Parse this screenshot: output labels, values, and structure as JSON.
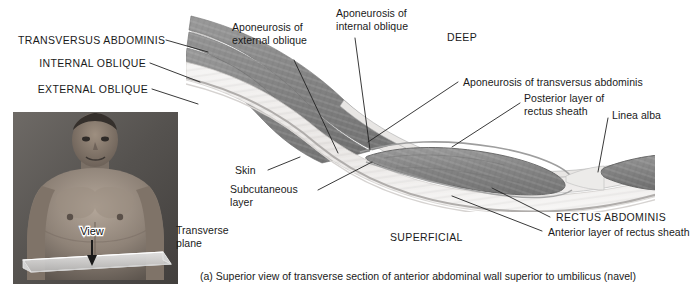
{
  "figure": {
    "caption": "(a) Superior view of transverse section of anterior abdominal wall superior to umbilicus (navel)",
    "background_color": "#ffffff",
    "text_color": "#1a1a1a",
    "leader_line_color": "#222222"
  },
  "orientation_labels": [
    {
      "id": "deep",
      "text": "DEEP"
    },
    {
      "id": "superficial",
      "text": "SUPERFICIAL"
    }
  ],
  "left_labels": [
    {
      "id": "transversus-abdominis",
      "text": "TRANSVERSUS ABDOMINIS",
      "style": "caps"
    },
    {
      "id": "internal-oblique",
      "text": "INTERNAL OBLIQUE",
      "style": "caps"
    },
    {
      "id": "external-oblique",
      "text": "EXTERNAL OBLIQUE",
      "style": "caps"
    }
  ],
  "top_labels": [
    {
      "id": "aponeurosis-external-oblique",
      "line1": "Aponeurosis of",
      "line2": "external oblique"
    },
    {
      "id": "aponeurosis-internal-oblique",
      "line1": "Aponeurosis of",
      "line2": "internal oblique"
    }
  ],
  "right_labels": [
    {
      "id": "aponeurosis-transversus-abdominis",
      "text": "Aponeurosis of transversus abdominis"
    },
    {
      "id": "posterior-layer-rectus-sheath",
      "line1": "Posterior layer of",
      "line2": "rectus sheath"
    },
    {
      "id": "linea-alba",
      "text": "Linea alba"
    },
    {
      "id": "rectus-abdominis",
      "text": "RECTUS ABDOMINIS",
      "style": "caps"
    },
    {
      "id": "anterior-layer-rectus-sheath",
      "text": "Anterior layer of rectus sheath"
    }
  ],
  "lower_left_labels": [
    {
      "id": "skin",
      "text": "Skin"
    },
    {
      "id": "subcutaneous-layer",
      "line1": "Subcutaneous",
      "line2": "layer"
    }
  ],
  "photo": {
    "view_label": "View",
    "transverse_plane": {
      "line1": "Transverse",
      "line2": "plane"
    }
  },
  "colors": {
    "muscle_fill": "#8d8d8d",
    "muscle_dark": "#6f6f6f",
    "fascia_light": "#dcdcdc",
    "subcutaneous": "#eceae8",
    "skin_line": "#bdbdbd",
    "photo_skin": "#8a8178",
    "plane_plate": "#d8d8d8"
  }
}
